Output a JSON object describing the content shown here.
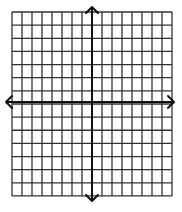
{
  "diagram": {
    "type": "coordinate-grid",
    "grid": {
      "columns": 16,
      "rows": 14,
      "left": 12,
      "top": 12,
      "cell_width": 10,
      "cell_height": 13.14,
      "line_color": "#333333",
      "line_width": 1.3
    },
    "axes": {
      "color": "#111111",
      "line_width": 2,
      "x_axis": {
        "y": 102,
        "x_start": 6,
        "x_end": 174,
        "arrows": [
          "left",
          "right"
        ]
      },
      "y_axis": {
        "x": 92,
        "y_start": 7,
        "y_end": 201,
        "arrows": [
          "up",
          "down"
        ]
      }
    },
    "labels": []
  }
}
